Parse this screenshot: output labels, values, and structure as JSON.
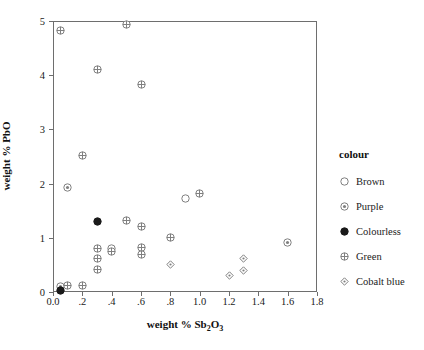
{
  "chart_data": {
    "type": "scatter",
    "title": "",
    "xlabel": "weight % Sb2O3",
    "xlabel_parts": {
      "prefix": "weight % Sb",
      "sub1": "2",
      "mid": "O",
      "sub2": "3"
    },
    "ylabel": "weight % PbO",
    "xlim": [
      0.0,
      1.8
    ],
    "ylim": [
      0,
      5
    ],
    "xticks": [
      0.0,
      0.2,
      0.4,
      0.6,
      0.8,
      1.0,
      1.2,
      1.4,
      1.6,
      1.8
    ],
    "xticklabels": [
      "0.0",
      ".2",
      ".4",
      ".6",
      ".8",
      "1.0",
      "1.2",
      "1.4",
      "1.6",
      "1.8"
    ],
    "yticks": [
      0,
      1,
      2,
      3,
      4,
      5
    ],
    "yticklabels": [
      "0",
      "1",
      "2",
      "3",
      "4",
      "5"
    ],
    "grid": false,
    "legend_position": "right",
    "legend_title": "colour",
    "series": [
      {
        "name": "Brown",
        "marker": "open-circle",
        "points": [
          {
            "x": 0.9,
            "y": 1.72
          },
          {
            "x": 0.4,
            "y": 0.8
          }
        ]
      },
      {
        "name": "Purple",
        "marker": "dotted-circle",
        "points": [
          {
            "x": 0.1,
            "y": 1.93
          },
          {
            "x": 1.6,
            "y": 0.91
          },
          {
            "x": 0.05,
            "y": 0.1
          }
        ]
      },
      {
        "name": "Colourless",
        "marker": "filled-circle",
        "points": [
          {
            "x": 0.3,
            "y": 1.3
          },
          {
            "x": 0.05,
            "y": 0.02
          }
        ]
      },
      {
        "name": "Green",
        "marker": "crossed-circle",
        "points": [
          {
            "x": 0.5,
            "y": 4.93
          },
          {
            "x": 0.05,
            "y": 4.82
          },
          {
            "x": 0.3,
            "y": 4.11
          },
          {
            "x": 0.6,
            "y": 3.82
          },
          {
            "x": 0.2,
            "y": 2.52
          },
          {
            "x": 1.0,
            "y": 1.82
          },
          {
            "x": 0.5,
            "y": 1.31
          },
          {
            "x": 0.6,
            "y": 1.21
          },
          {
            "x": 0.8,
            "y": 1.01
          },
          {
            "x": 0.3,
            "y": 0.8
          },
          {
            "x": 0.6,
            "y": 0.82
          },
          {
            "x": 0.4,
            "y": 0.74
          },
          {
            "x": 0.6,
            "y": 0.7
          },
          {
            "x": 0.3,
            "y": 0.61
          },
          {
            "x": 0.3,
            "y": 0.41
          },
          {
            "x": 0.1,
            "y": 0.12
          },
          {
            "x": 0.2,
            "y": 0.12
          }
        ]
      },
      {
        "name": "Cobalt blue",
        "marker": "dotted-diamond",
        "points": [
          {
            "x": 1.3,
            "y": 0.62
          },
          {
            "x": 0.8,
            "y": 0.51
          },
          {
            "x": 1.3,
            "y": 0.4
          },
          {
            "x": 1.2,
            "y": 0.31
          }
        ]
      }
    ]
  },
  "colors": {
    "axis": "#6e6e6e",
    "marker_stroke": "#808080",
    "marker_fill_solid": "#1a1a1a",
    "text": "#1a1a1a"
  }
}
